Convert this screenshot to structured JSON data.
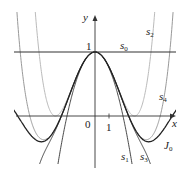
{
  "chart_data": {
    "type": "line",
    "title": "",
    "xlabel": "x",
    "ylabel": "y",
    "xlim": [
      -6.8,
      6.6
    ],
    "ylim": [
      -1.15,
      1.45
    ],
    "grid": false,
    "tick_labels": {
      "x": [
        "0",
        "1"
      ],
      "y": [
        "1"
      ]
    },
    "series": [
      {
        "name": "s0",
        "label": "s",
        "sub": "0",
        "formula": "1",
        "color": "#333333",
        "width": 1.1
      },
      {
        "name": "s1",
        "label": "s",
        "sub": "1",
        "formula": "1 - x^2/4",
        "color": "#333333",
        "width": 0.9
      },
      {
        "name": "s2",
        "label": "s",
        "sub": "2",
        "formula": "1 - x^2/4 + x^4/64",
        "color": "#bbbbbb",
        "width": 1.0
      },
      {
        "name": "s3",
        "label": "s",
        "sub": "3",
        "formula": "1 - x^2/4 + x^4/64 - x^6/2304",
        "color": "#333333",
        "width": 0.9
      },
      {
        "name": "s4",
        "label": "s",
        "sub": "4",
        "formula": "1 - x^2/4 + x^4/64 - x^6/2304 + x^8/147456",
        "color": "#999999",
        "width": 1.0
      },
      {
        "name": "J0",
        "label": "J",
        "sub": "0",
        "formula": "Bessel J0(x)",
        "color": "#222222",
        "width": 1.3
      }
    ],
    "annotations": [
      {
        "text": "s0",
        "x": 2.0,
        "y": 1.05
      },
      {
        "text": "s2",
        "x": 5.0,
        "y": 1.35
      },
      {
        "text": "s4",
        "x": 5.4,
        "y": 0.22
      },
      {
        "text": "J0",
        "x": 5.0,
        "y": -0.55
      },
      {
        "text": "s1",
        "x": 2.3,
        "y": -0.85
      },
      {
        "text": "s3",
        "x": 3.5,
        "y": -0.85
      }
    ]
  },
  "axes": {
    "x_label": "x",
    "y_label": "y",
    "origin_label": "0",
    "x_tick_label": "1",
    "y_tick_label": "1"
  },
  "labels": {
    "s0": {
      "main": "s",
      "sub": "0"
    },
    "s1": {
      "main": "s",
      "sub": "1"
    },
    "s2": {
      "main": "s",
      "sub": "2"
    },
    "s3": {
      "main": "s",
      "sub": "3"
    },
    "s4": {
      "main": "s",
      "sub": "4"
    },
    "J0": {
      "main": "J",
      "sub": "0"
    }
  }
}
